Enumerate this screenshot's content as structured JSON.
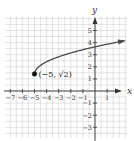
{
  "chart_data": {
    "type": "line",
    "title": "",
    "xlabel": "x",
    "ylabel": "y",
    "xlim": [
      -7.5,
      2.5
    ],
    "ylim": [
      -3.8,
      5.8
    ],
    "grid": true,
    "grid_step": 0.5,
    "x_ticks": [
      -7,
      -6,
      -5,
      -4,
      -3,
      -2,
      -1,
      1
    ],
    "x_tick_labels": [
      "−7",
      "−6",
      "−5",
      "−4",
      "−3",
      "−2",
      "−1",
      "1"
    ],
    "y_ticks": [
      5,
      4,
      3,
      2,
      1,
      -1,
      -2,
      -3
    ],
    "y_tick_labels": [
      "5",
      "4",
      "3",
      "2",
      "1",
      "−1",
      "−2",
      "−3"
    ],
    "series": [
      {
        "name": "f(x) = √(x+5) + √2",
        "function": "sqrt(x+5)+sqrt(2)",
        "x_start": -5,
        "x_end": 2.4,
        "end_arrow": true,
        "color": "#4a4a4a",
        "points": [
          {
            "x": -5,
            "y": 1.41
          },
          {
            "x": -4,
            "y": 2.41
          },
          {
            "x": -3,
            "y": 2.83
          },
          {
            "x": -2,
            "y": 3.15
          },
          {
            "x": -1,
            "y": 3.86
          },
          {
            "x": 0,
            "y": 3.65
          },
          {
            "x": 1,
            "y": 3.86
          },
          {
            "x": 2,
            "y": 4.06
          }
        ]
      }
    ],
    "marked_points": [
      {
        "x": -5,
        "y": 1.41,
        "label": "(−5, √2)",
        "filled": true
      }
    ],
    "colors": {
      "grid": "#c8c8c8",
      "axis": "#333333",
      "curve": "#4a4a4a",
      "point": "#111111"
    }
  }
}
